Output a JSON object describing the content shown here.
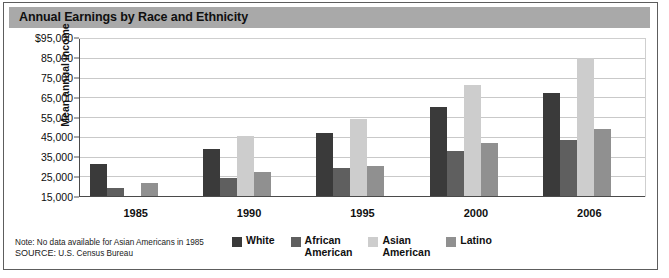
{
  "figure": {
    "title": "Annual Earnings by Race and Ethnicity",
    "note": "Note: No data available for Asian Americans in 1985",
    "source_prefix": "SOURCE:",
    "source_text": "U.S. Census Bureau"
  },
  "colors": {
    "title_bar": "#a9a9a9",
    "frame": "#5d5d5d",
    "gridline": "#c9c9c9",
    "axis": "#4a4a4a",
    "white_series": "#3a3a3a",
    "african_american_series": "#5f5f5f",
    "asian_american_series": "#cdcdcd",
    "latino_series": "#909090"
  },
  "legend": {
    "position": "bottom-center",
    "items": [
      {
        "label": "White",
        "color": "#3a3a3a"
      },
      {
        "label": "African\nAmerican",
        "color": "#5f5f5f"
      },
      {
        "label": "Asian\nAmerican",
        "color": "#cdcdcd"
      },
      {
        "label": "Latino",
        "color": "#909090"
      }
    ]
  },
  "chart_data": {
    "type": "bar",
    "title": "Annual Earnings by Race and Ethnicity",
    "xlabel": "",
    "ylabel": "Mean annual income",
    "ylim": [
      15000,
      95000
    ],
    "ytick_labels": [
      "$95,000",
      "85,000",
      "75,000",
      "65,000",
      "55,000",
      "45,000",
      "35,000",
      "25,000",
      "15,000"
    ],
    "ytick_values": [
      95000,
      85000,
      75000,
      65000,
      55000,
      45000,
      35000,
      25000,
      15000
    ],
    "grid": true,
    "categories": [
      "1985",
      "1990",
      "1995",
      "2000",
      "2006"
    ],
    "series": [
      {
        "name": "White",
        "color": "#3a3a3a",
        "values": [
          31000,
          39000,
          47000,
          60000,
          67000
        ]
      },
      {
        "name": "African American",
        "color": "#5f5f5f",
        "values": [
          19000,
          24000,
          29000,
          38000,
          43500
        ]
      },
      {
        "name": "Asian American",
        "color": "#cdcdcd",
        "values": [
          null,
          45500,
          54000,
          71000,
          85000
        ]
      },
      {
        "name": "Latino",
        "color": "#909090",
        "values": [
          21500,
          27000,
          30000,
          42000,
          49000
        ]
      }
    ],
    "annotations": [
      "Note: No data available for Asian Americans in 1985",
      "SOURCE: U.S. Census Bureau"
    ]
  }
}
